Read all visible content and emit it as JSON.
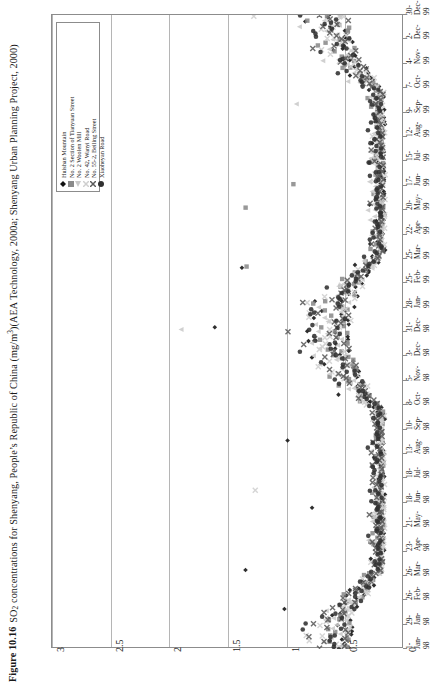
{
  "caption": {
    "number": "Figure 10.16",
    "text_before_sub": "SO",
    "sub": "2",
    "text_mid": " concentrations for Shenyang, People’s Republic of China  (mg/m",
    "sup": "3",
    "text_after": ")(AEA Technology, 2000a; Shenyang Urban Planning Project, 2000)"
  },
  "chart_data": {
    "type": "scatter",
    "orientation": "rotated-90-ccw",
    "xlabel": "",
    "ylabel": "",
    "ylim": [
      0,
      3
    ],
    "yticks": [
      "0",
      "0.5",
      "1",
      "1.5",
      "2",
      "2.5",
      "3"
    ],
    "ytick_values": [
      0,
      0.5,
      1,
      1.5,
      2,
      2.5,
      3
    ],
    "grid": "vertical-gridlines-at-yticks",
    "legend_position": "top-left-inside",
    "xticks": [
      {
        "d": "1-",
        "m": "Jan-",
        "y": "98"
      },
      {
        "d": "29-",
        "m": "Jan-",
        "y": "98"
      },
      {
        "d": "26-",
        "m": "Feb-",
        "y": "98"
      },
      {
        "d": "26-",
        "m": "Mar-",
        "y": "98"
      },
      {
        "d": "23-",
        "m": "Apr-",
        "y": "98"
      },
      {
        "d": "21-",
        "m": "May-",
        "y": "98"
      },
      {
        "d": "18-",
        "m": "Jun-",
        "y": "98"
      },
      {
        "d": "18-",
        "m": "Jul-",
        "y": "98"
      },
      {
        "d": "13-",
        "m": "Aug-",
        "y": "98"
      },
      {
        "d": "10-",
        "m": "Sep-",
        "y": "98"
      },
      {
        "d": "8-",
        "m": "Oct-",
        "y": "98"
      },
      {
        "d": "5-",
        "m": "Nov-",
        "y": "98"
      },
      {
        "d": "3-",
        "m": "Dec-",
        "y": "98"
      },
      {
        "d": "31-",
        "m": "Dec-",
        "y": "98"
      },
      {
        "d": "28-",
        "m": "Jan-",
        "y": "99"
      },
      {
        "d": "25-",
        "m": "Feb-",
        "y": "99"
      },
      {
        "d": "25-",
        "m": "Mar-",
        "y": "99"
      },
      {
        "d": "22-",
        "m": "Apr-",
        "y": "99"
      },
      {
        "d": "20-",
        "m": "May-",
        "y": "99"
      },
      {
        "d": "17-",
        "m": "Jun-",
        "y": "99"
      },
      {
        "d": "15-",
        "m": "Jul-",
        "y": "99"
      },
      {
        "d": "12-",
        "m": "Aug-",
        "y": "99"
      },
      {
        "d": "9-",
        "m": "Sep-",
        "y": "99"
      },
      {
        "d": "7-",
        "m": "Oct-",
        "y": "99"
      },
      {
        "d": "4-",
        "m": "Nov-",
        "y": "99"
      },
      {
        "d": "2-",
        "m": "Dec-",
        "y": "99"
      },
      {
        "d": "30-",
        "m": "Dec-",
        "y": "99"
      }
    ],
    "series": [
      {
        "name": "Huishan Mountain",
        "marker": "diamond",
        "color": "#111111"
      },
      {
        "name": "No. 2 Section of Tianyuan Street",
        "marker": "square",
        "color": "#8a8a8a"
      },
      {
        "name": "No. 2 Woolen Mill",
        "marker": "triangle",
        "color": "#c9c9c9"
      },
      {
        "name": "No. 42, Wanyi Road",
        "marker": "cross",
        "color": "#cfcfcf"
      },
      {
        "name": "No. 55-2, Beiling Street",
        "marker": "cross",
        "color": "#5a5a5a"
      },
      {
        "name": "Xiaoheyan Road",
        "marker": "circle",
        "color": "#303030"
      }
    ]
  },
  "legend": {
    "items": [
      {
        "label": "Huishan Mountain"
      },
      {
        "label": "No. 2 Section of Tianyuan Street"
      },
      {
        "label": "No. 2 Woolen Mill"
      },
      {
        "label": "No. 42, Wanyi Road"
      },
      {
        "label": "No. 55-2, Beiling Street"
      },
      {
        "label": "Xiaoheyan Road"
      }
    ]
  }
}
